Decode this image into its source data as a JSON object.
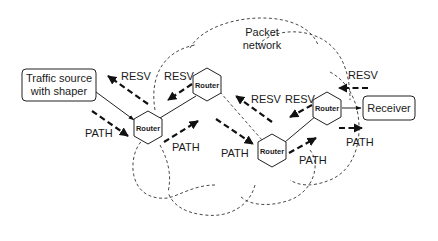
{
  "diagram": {
    "cloud_label": [
      "Packet",
      "network"
    ],
    "nodes": {
      "source": {
        "label": [
          "Traffic source",
          "with shaper"
        ]
      },
      "receiver": {
        "label": "Receiver"
      },
      "routers": [
        {
          "id": "router-1",
          "label": "Router"
        },
        {
          "id": "router-2",
          "label": "Router"
        },
        {
          "id": "router-3",
          "label": "Router"
        },
        {
          "id": "router-4",
          "label": "Router"
        }
      ]
    },
    "messages": {
      "resv": [
        {
          "label": "RESV",
          "segment": "router-1 to source"
        },
        {
          "label": "RESV",
          "segment": "router-2 to router-1"
        },
        {
          "label": "RESV",
          "segment": "router-3 to router-2"
        },
        {
          "label": "RESV",
          "segment": "router-4 to router-3"
        },
        {
          "label": "RESV",
          "segment": "receiver to router-4"
        }
      ],
      "path": [
        {
          "label": "PATH",
          "segment": "source to router-1"
        },
        {
          "label": "PATH",
          "segment": "router-1 to router-2"
        },
        {
          "label": "PATH",
          "segment": "router-2 to router-3"
        },
        {
          "label": "PATH",
          "segment": "router-3 to router-4"
        },
        {
          "label": "PATH",
          "segment": "router-4 to receiver"
        }
      ]
    }
  }
}
